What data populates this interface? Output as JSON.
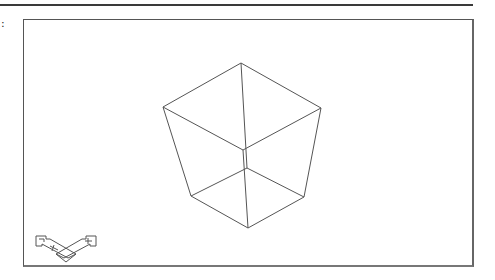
{
  "app": {
    "side_marker": ":"
  },
  "viewport": {
    "name": "drawing-viewport",
    "object": "wireframe-frustum",
    "line_color": "#555555",
    "background": "#ffffff"
  },
  "model": {
    "vertices": {
      "top": [
        241,
        63
      ],
      "left": [
        163,
        107
      ],
      "right": [
        321,
        108
      ],
      "inner_top": [
        243,
        150
      ],
      "inner_bottom": [
        247,
        168
      ],
      "bottom_left": [
        191,
        196
      ],
      "bottom_right": [
        304,
        197
      ],
      "bottom": [
        248,
        228
      ]
    }
  },
  "ucs_icon": {
    "type": "paper-space-ucs-icon",
    "position": [
      35,
      235
    ]
  }
}
